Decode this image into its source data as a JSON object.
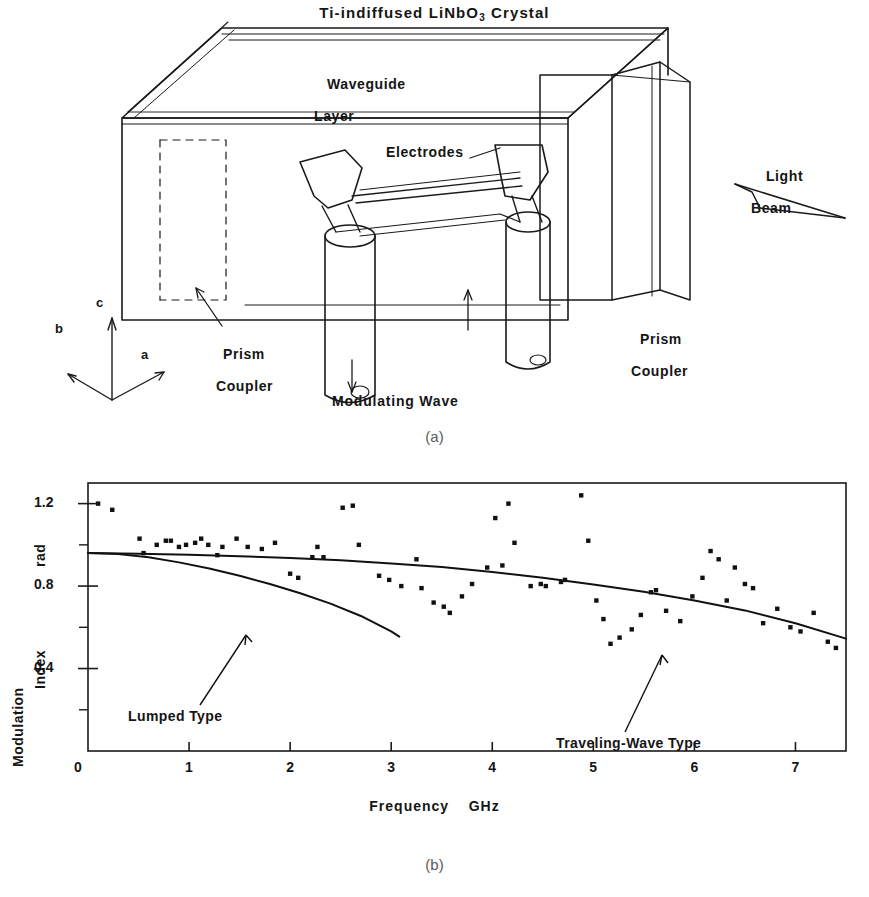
{
  "figure": {
    "panel_a_caption": "(a)",
    "panel_b_caption": "(b)"
  },
  "diagram": {
    "title_part1": "Ti-indiffused LiNbO",
    "title_sub": "3",
    "title_part2": " Crystal",
    "labels": {
      "waveguide_line1": "Waveguide",
      "waveguide_line2": "Layer",
      "electrodes": "Electrodes",
      "light_beam_line1": "Light",
      "light_beam_line2": "Beam",
      "prism_coupler_left_line1": "Prism",
      "prism_coupler_left_line2": "Coupler",
      "prism_coupler_right_line1": "Prism",
      "prism_coupler_right_line2": "Coupler",
      "modulating_wave": "Modulating Wave",
      "axis_a": "a",
      "axis_b": "b",
      "axis_c": "c"
    }
  },
  "chart_data": {
    "type": "scatter",
    "title": "",
    "xlabel": "Frequency    GHz",
    "xlabel_name": "Frequency",
    "xlabel_unit": "GHz",
    "ylabel_line1": "Modulation",
    "ylabel_line2": "Index",
    "ylabel_line3": "rad",
    "ylabel": "Modulation Index  rad",
    "xlim": [
      0,
      7.5
    ],
    "ylim": [
      0,
      1.3
    ],
    "xticks": [
      0,
      1,
      2,
      3,
      4,
      5,
      6,
      7
    ],
    "xticklabels": [
      "0",
      "1",
      "2",
      "3",
      "4",
      "5",
      "6",
      "7"
    ],
    "yticks": [
      0,
      0.4,
      0.8,
      1.2
    ],
    "yticklabels": [
      "0",
      "0.4",
      "0.8",
      "1.2"
    ],
    "yminorticks": [
      0.2,
      0.6,
      1.0
    ],
    "grid": false,
    "legend_position": "inline-annotations",
    "annotations": [
      {
        "text": "Lumped Type",
        "points_to_curve": "lumped"
      },
      {
        "text": "Traveling-Wave Type",
        "points_to_curve": "traveling_wave"
      }
    ],
    "series": [
      {
        "name": "Measured modulation index",
        "type": "scatter",
        "marker": "square",
        "color": "#111111",
        "points": [
          [
            0.1,
            1.2
          ],
          [
            0.24,
            1.17
          ],
          [
            0.51,
            1.03
          ],
          [
            0.55,
            0.96
          ],
          [
            0.68,
            1.0
          ],
          [
            0.77,
            1.02
          ],
          [
            0.82,
            1.02
          ],
          [
            0.9,
            0.99
          ],
          [
            0.97,
            1.0
          ],
          [
            1.06,
            1.01
          ],
          [
            1.12,
            1.03
          ],
          [
            1.19,
            1.0
          ],
          [
            1.28,
            0.95
          ],
          [
            1.33,
            0.99
          ],
          [
            1.47,
            1.03
          ],
          [
            1.58,
            0.99
          ],
          [
            1.72,
            0.98
          ],
          [
            1.85,
            1.01
          ],
          [
            2.0,
            0.86
          ],
          [
            2.08,
            0.84
          ],
          [
            2.22,
            0.94
          ],
          [
            2.27,
            0.99
          ],
          [
            2.33,
            0.94
          ],
          [
            2.52,
            1.18
          ],
          [
            2.62,
            1.19
          ],
          [
            2.68,
            1.0
          ],
          [
            2.88,
            0.85
          ],
          [
            2.98,
            0.83
          ],
          [
            3.1,
            0.8
          ],
          [
            3.25,
            0.93
          ],
          [
            3.3,
            0.79
          ],
          [
            3.42,
            0.72
          ],
          [
            3.52,
            0.7
          ],
          [
            3.58,
            0.67
          ],
          [
            3.7,
            0.75
          ],
          [
            3.8,
            0.81
          ],
          [
            3.95,
            0.89
          ],
          [
            4.03,
            1.13
          ],
          [
            4.1,
            0.9
          ],
          [
            4.16,
            1.2
          ],
          [
            4.22,
            1.01
          ],
          [
            4.38,
            0.8
          ],
          [
            4.48,
            0.81
          ],
          [
            4.53,
            0.8
          ],
          [
            4.68,
            0.82
          ],
          [
            4.72,
            0.83
          ],
          [
            4.88,
            1.24
          ],
          [
            4.95,
            1.02
          ],
          [
            5.03,
            0.73
          ],
          [
            5.1,
            0.64
          ],
          [
            5.17,
            0.52
          ],
          [
            5.26,
            0.55
          ],
          [
            5.38,
            0.59
          ],
          [
            5.47,
            0.66
          ],
          [
            5.57,
            0.77
          ],
          [
            5.62,
            0.78
          ],
          [
            5.72,
            0.68
          ],
          [
            5.86,
            0.63
          ],
          [
            5.98,
            0.75
          ],
          [
            6.08,
            0.84
          ],
          [
            6.16,
            0.97
          ],
          [
            6.24,
            0.93
          ],
          [
            6.32,
            0.73
          ],
          [
            6.4,
            0.89
          ],
          [
            6.5,
            0.81
          ],
          [
            6.58,
            0.79
          ],
          [
            6.68,
            0.62
          ],
          [
            6.82,
            0.69
          ],
          [
            6.95,
            0.6
          ],
          [
            7.05,
            0.58
          ],
          [
            7.18,
            0.67
          ],
          [
            7.32,
            0.53
          ],
          [
            7.4,
            0.5
          ]
        ]
      },
      {
        "name": "Lumped Type",
        "type": "line",
        "color": "#111111",
        "points": [
          [
            0.0,
            0.96
          ],
          [
            0.3,
            0.955
          ],
          [
            0.6,
            0.94
          ],
          [
            0.9,
            0.915
          ],
          [
            1.2,
            0.885
          ],
          [
            1.5,
            0.85
          ],
          [
            1.8,
            0.81
          ],
          [
            2.1,
            0.765
          ],
          [
            2.4,
            0.715
          ],
          [
            2.7,
            0.655
          ],
          [
            3.0,
            0.58
          ],
          [
            3.08,
            0.555
          ]
        ]
      },
      {
        "name": "Traveling-Wave Type",
        "type": "line",
        "color": "#111111",
        "points": [
          [
            0.0,
            0.96
          ],
          [
            0.5,
            0.957
          ],
          [
            1.0,
            0.952
          ],
          [
            1.5,
            0.945
          ],
          [
            2.0,
            0.936
          ],
          [
            2.5,
            0.925
          ],
          [
            3.0,
            0.91
          ],
          [
            3.5,
            0.892
          ],
          [
            4.0,
            0.868
          ],
          [
            4.5,
            0.84
          ],
          [
            5.0,
            0.808
          ],
          [
            5.5,
            0.772
          ],
          [
            6.0,
            0.73
          ],
          [
            6.5,
            0.682
          ],
          [
            7.0,
            0.62
          ],
          [
            7.5,
            0.545
          ]
        ]
      }
    ]
  }
}
